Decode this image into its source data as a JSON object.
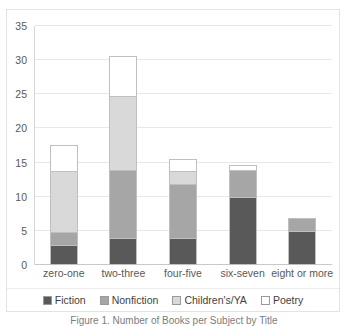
{
  "chart_data": {
    "type": "bar",
    "subtype": "stacked-bar",
    "title": "",
    "xlabel": "",
    "ylabel": "",
    "ylim": [
      0,
      35
    ],
    "ytick_step": 5,
    "yticks": [
      0,
      5,
      10,
      15,
      20,
      25,
      30,
      35
    ],
    "grid": true,
    "legend_position": "bottom",
    "categories": [
      "zero-one",
      "two-three",
      "four-five",
      "six-seven",
      "eight or more"
    ],
    "series": [
      {
        "name": "Fiction",
        "color": "#595959",
        "values": [
          3,
          4,
          4,
          10,
          5
        ]
      },
      {
        "name": "Nonfiction",
        "color": "#a6a6a6",
        "values": [
          2,
          10,
          8,
          4,
          2
        ]
      },
      {
        "name": "Children's/YA",
        "color": "#d9d9d9",
        "values": [
          9,
          11,
          2,
          0,
          0
        ]
      },
      {
        "name": "Poetry",
        "color": "#ffffff",
        "values": [
          4,
          6,
          2,
          1,
          0
        ]
      }
    ],
    "totals": [
      18,
      31,
      16,
      15,
      7
    ]
  },
  "caption": {
    "text": "Figure 1. Number of Books per Subject by Title"
  }
}
